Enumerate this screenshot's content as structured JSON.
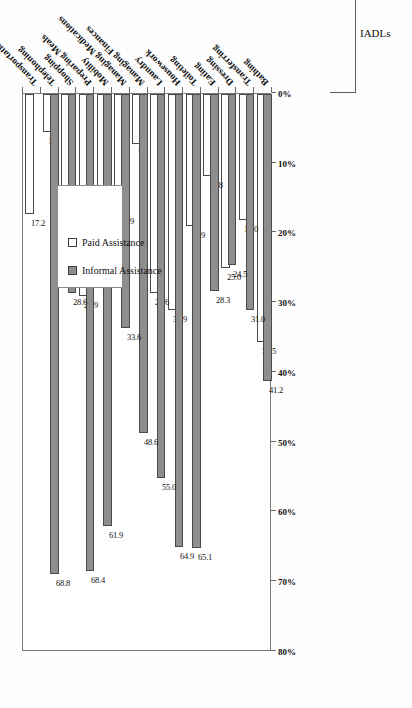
{
  "chart_data": {
    "type": "bar",
    "orientation": "horizontal",
    "title": "",
    "xlabel": "",
    "ylabel": "",
    "xlim": [
      0,
      80
    ],
    "grid": false,
    "legend_position": "inside-left",
    "annotation": "n = 285",
    "axis_ticks": [
      "80%",
      "70%",
      "60%",
      "50%",
      "40%",
      "30%",
      "20%",
      "10%",
      "0%"
    ],
    "axis_tick_values": [
      80,
      70,
      60,
      50,
      40,
      30,
      20,
      10,
      0
    ],
    "categories": [
      "Bathing",
      "Transferring",
      "Dressing",
      "Eating",
      "Toileting",
      "Housework",
      "Laundry",
      "Managing Finances",
      "Managing Medications",
      "Mobility",
      "Preparing Meals",
      "Shopping",
      "Telephoning",
      "Transportation"
    ],
    "series": [
      {
        "name": "Informal Assistance",
        "color": "#8e8e8e",
        "values": [
          41.2,
          31.0,
          24.5,
          28.3,
          65.1,
          64.9,
          55.0,
          48.6,
          33.6,
          61.9,
          68.4,
          28.6,
          68.8,
          0.0
        ],
        "labels": [
          "41.2",
          "31.0",
          "24.5",
          "28.3",
          "65.1",
          "64.9",
          "55.0",
          "48.6",
          "33.6",
          "61.9",
          "68.4",
          "28.6",
          "68.8",
          ""
        ]
      },
      {
        "name": "Paid Assistance",
        "color": "#ffffff",
        "values": [
          35.5,
          18.0,
          25.0,
          11.8,
          18.9,
          30.9,
          28.6,
          7.1,
          16.9,
          21.7,
          28.9,
          16.5,
          5.4,
          17.2
        ],
        "labels": [
          "35.5",
          "18.0",
          "25.0",
          "11.8",
          "18.9",
          "30.9",
          "28.6",
          "7.1",
          "16.9",
          "21.7",
          "28.9",
          "16.5",
          "5.4",
          "17.2"
        ]
      }
    ],
    "groups": [
      {
        "label": "ADLs",
        "from": "Bathing",
        "to": "Toileting"
      },
      {
        "label": "IADLs",
        "from": "Housework",
        "to": "Transportation"
      }
    ]
  },
  "legend": {
    "items": [
      {
        "label": "Informal Assistance",
        "swatch": "informal"
      },
      {
        "label": "Paid Assistance",
        "swatch": "paid"
      }
    ]
  }
}
